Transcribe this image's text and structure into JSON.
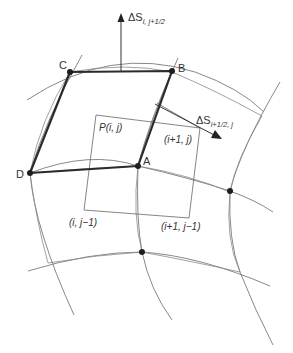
{
  "diagram": {
    "vertices": {
      "A": "A",
      "B": "B",
      "C": "C",
      "D": "D"
    },
    "control_volume_labels": {
      "center": "P(i, j)",
      "east": "(i+1, j)",
      "south": "(i, j−1)",
      "southeast": "(i+1, j−1)"
    },
    "surface_vectors": {
      "north": {
        "symbol": "ΔS",
        "subscript": "i, j+1/2"
      },
      "east": {
        "symbol": "ΔS",
        "subscript": "i+1/2, j"
      }
    }
  }
}
